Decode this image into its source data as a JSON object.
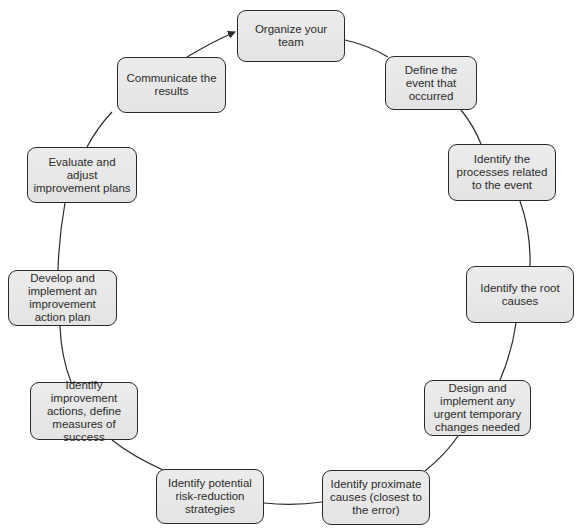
{
  "diagram": {
    "type": "cycle",
    "direction": "clockwise",
    "colors": {
      "node_fill": "#e8e8e8",
      "node_border": "#2a2a2a",
      "connector": "#2a2a2a",
      "text": "#2b2b2b"
    },
    "nodes": [
      {
        "id": "n1",
        "label": "Organize your team",
        "x": 237,
        "y": 10,
        "w": 108,
        "h": 52
      },
      {
        "id": "n2",
        "label": "Define the event that occurred",
        "x": 385,
        "y": 56,
        "w": 92,
        "h": 54
      },
      {
        "id": "n3",
        "label": "Identify the processes related to the event",
        "x": 448,
        "y": 144,
        "w": 108,
        "h": 57
      },
      {
        "id": "n4",
        "label": "Identify the root causes",
        "x": 466,
        "y": 266,
        "w": 108,
        "h": 57
      },
      {
        "id": "n5",
        "label": "Design and implement any urgent temporary changes needed",
        "x": 424,
        "y": 380,
        "w": 107,
        "h": 56
      },
      {
        "id": "n6",
        "label": "Identify proximate causes (closest to the error)",
        "x": 322,
        "y": 470,
        "w": 108,
        "h": 55
      },
      {
        "id": "n7",
        "label": "Identify potential risk-reduction strategies",
        "x": 156,
        "y": 469,
        "w": 108,
        "h": 55
      },
      {
        "id": "n8",
        "label": "Identify improvement actions, define measures of success",
        "x": 30,
        "y": 382,
        "w": 108,
        "h": 58
      },
      {
        "id": "n9",
        "label": "Develop and implement an improvement action plan",
        "x": 8,
        "y": 270,
        "w": 109,
        "h": 56
      },
      {
        "id": "n10",
        "label": "Evaluate and adjust improvement plans",
        "x": 27,
        "y": 147,
        "w": 110,
        "h": 56
      },
      {
        "id": "n11",
        "label": "Communicate the results",
        "x": 117,
        "y": 57,
        "w": 109,
        "h": 56
      }
    ],
    "edges": [
      {
        "from": "n1",
        "to": "n2",
        "d": "M345,40 Q368,45 388,57",
        "arrow": false
      },
      {
        "from": "n2",
        "to": "n3",
        "d": "M461,110 Q474,126 481,144",
        "arrow": false
      },
      {
        "from": "n3",
        "to": "n4",
        "d": "M520,201 Q531,232 530,266",
        "arrow": false
      },
      {
        "from": "n4",
        "to": "n5",
        "d": "M516,323 Q512,352 500,380",
        "arrow": false
      },
      {
        "from": "n5",
        "to": "n6",
        "d": "M458,436 Q446,454 425,471",
        "arrow": false
      },
      {
        "from": "n6",
        "to": "n7",
        "d": "M322,502 Q293,506 264,503",
        "arrow": false
      },
      {
        "from": "n7",
        "to": "n8",
        "d": "M163,470 Q132,456 112,440",
        "arrow": false
      },
      {
        "from": "n8",
        "to": "n9",
        "d": "M71,382 Q61,356 60,326",
        "arrow": false
      },
      {
        "from": "n9",
        "to": "n10",
        "d": "M58,270 Q59,236 65,203",
        "arrow": false
      },
      {
        "from": "n10",
        "to": "n11",
        "d": "M87,147 Q97,128 112,112",
        "arrow": false
      },
      {
        "from": "n11",
        "to": "n1",
        "d": "M187,57 Q212,42 235,32",
        "arrow": true
      }
    ]
  }
}
